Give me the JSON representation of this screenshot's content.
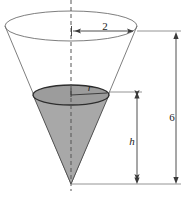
{
  "figure": {
    "type": "geometry-diagram",
    "background_color": "#ffffff"
  },
  "labels": {
    "top_radius": "2",
    "total_height": "6",
    "inner_radius": "r",
    "inner_height": "h"
  },
  "colors": {
    "outline": "#6f6f6f",
    "inner_outline": "#3a3a3a",
    "inner_fill": "#a8a8a8",
    "inner_top_fill": "#9a9a9a",
    "dimension_line": "#4a4a4a",
    "axis_dash": "#5a5a5a",
    "text": "#222222"
  },
  "geometry": {
    "outer_cone": {
      "ellipse_center_x": 71,
      "ellipse_center_y": 26,
      "ellipse_rx": 66,
      "ellipse_ry": 15,
      "apex_x": 71,
      "apex_y": 184
    },
    "inner_cone": {
      "ellipse_center_x": 71,
      "ellipse_center_y": 95,
      "ellipse_rx": 38,
      "ellipse_ry": 10,
      "apex_x": 71,
      "apex_y": 184
    },
    "axis": {
      "x": 71,
      "y_top": 0,
      "y_bottom": 191
    },
    "dimension_2": {
      "y": 31,
      "x_start": 71,
      "x_end": 137,
      "label_x": 105,
      "label_y": 29
    },
    "dimension_h": {
      "x": 137,
      "y_top": 92,
      "y_bottom": 184,
      "label_x": 133,
      "label_y": 142
    },
    "dimension_6": {
      "x": 176,
      "y_top": 33,
      "y_bottom": 184,
      "label_x": 172,
      "label_y": 118
    }
  }
}
